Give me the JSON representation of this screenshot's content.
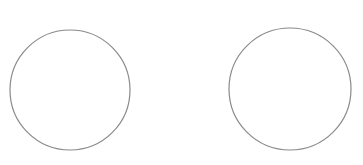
{
  "canvas": {
    "width": 363,
    "height": 165,
    "background": "#ffffff"
  },
  "shapes": [
    {
      "type": "circle",
      "cx": 70,
      "cy": 90,
      "r": 60,
      "stroke": "#8a8a8a",
      "fill": "none"
    },
    {
      "type": "circle",
      "cx": 290,
      "cy": 89,
      "r": 61,
      "stroke": "#8a8a8a",
      "fill": "none"
    }
  ]
}
